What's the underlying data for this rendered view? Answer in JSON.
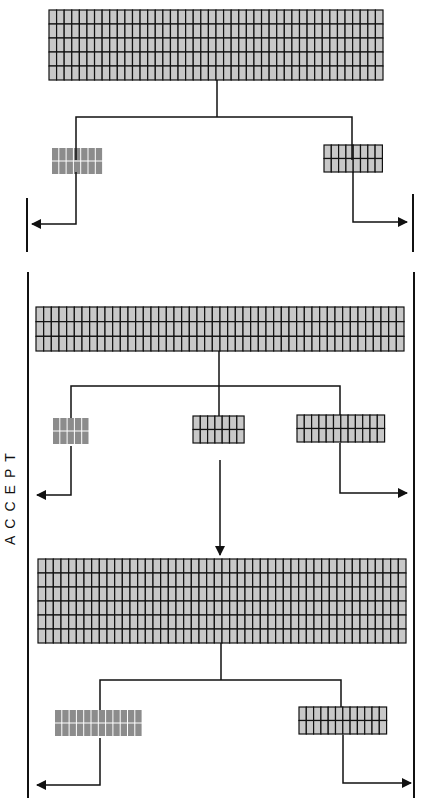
{
  "label": {
    "accept": "ACCEPT"
  },
  "colors": {
    "cell_fill": "#c8c8c8",
    "cell_fill_dark": "#8c8c8c",
    "line": "#111111",
    "background": "#ffffff"
  },
  "stages": [
    {
      "name": "stage-1",
      "main_block": {
        "x": 49,
        "y": 10,
        "w": 334,
        "h": 70,
        "cols": 44,
        "rows": 5
      },
      "outputs": [
        {
          "side": "left",
          "x": 52,
          "y": 148,
          "cols": 7,
          "rows": 2,
          "style": "rejected"
        },
        {
          "side": "right",
          "x": 324,
          "y": 145,
          "cols": 8,
          "rows": 2,
          "style": "accepted"
        }
      ]
    },
    {
      "name": "stage-2",
      "main_block": {
        "x": 36,
        "y": 307,
        "w": 368,
        "h": 44,
        "cols": 48,
        "rows": 3
      },
      "outputs": [
        {
          "side": "left",
          "x": 53,
          "y": 418,
          "cols": 5,
          "rows": 2,
          "style": "rejected"
        },
        {
          "side": "center",
          "x": 193,
          "y": 416,
          "cols": 7,
          "rows": 2,
          "style": "accepted"
        },
        {
          "side": "right",
          "x": 297,
          "y": 415,
          "cols": 12,
          "rows": 2,
          "style": "accepted"
        }
      ]
    },
    {
      "name": "stage-3",
      "main_block": {
        "x": 38,
        "y": 559,
        "w": 368,
        "h": 84,
        "cols": 48,
        "rows": 6
      },
      "outputs": [
        {
          "side": "left",
          "x": 55,
          "y": 710,
          "cols": 12,
          "rows": 2,
          "style": "rejected"
        },
        {
          "side": "right",
          "x": 299,
          "y": 707,
          "cols": 12,
          "rows": 2,
          "style": "accepted"
        }
      ]
    }
  ]
}
